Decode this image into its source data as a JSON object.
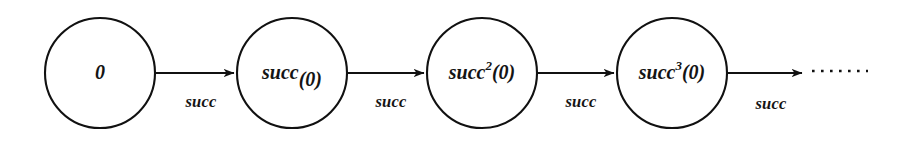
{
  "figure": {
    "background_color": "#ffffff",
    "stroke_color": "#111111",
    "text_color": "#141414"
  },
  "nodes": [
    {
      "id": "n0",
      "base": "0",
      "exponent": "",
      "suffix": "",
      "label": "0",
      "cx": 100,
      "cy": 73,
      "r": 55
    },
    {
      "id": "n1",
      "base": "succ",
      "exponent": "",
      "suffix": "(0)",
      "label": "succ(0)",
      "cx": 292,
      "cy": 73,
      "r": 55
    },
    {
      "id": "n2",
      "base": "succ",
      "exponent": "2",
      "suffix": "(0)",
      "label": "succ2(0)",
      "cx": 482,
      "cy": 73,
      "r": 55
    },
    {
      "id": "n3",
      "base": "succ",
      "exponent": "3",
      "suffix": "(0)",
      "label": "succ3(0)",
      "cx": 672,
      "cy": 73,
      "r": 55
    }
  ],
  "edges": [
    {
      "id": "e0",
      "label": "succ",
      "from": "n0",
      "to": "n1",
      "x1": 156,
      "x2": 234,
      "y": 73,
      "label_x": 201,
      "label_y": 107
    },
    {
      "id": "e1",
      "label": "succ",
      "from": "n1",
      "to": "n2",
      "x1": 348,
      "x2": 424,
      "y": 73,
      "label_x": 391,
      "label_y": 107
    },
    {
      "id": "e2",
      "label": "succ",
      "from": "n2",
      "to": "n3",
      "x1": 538,
      "x2": 614,
      "y": 73,
      "label_x": 581,
      "label_y": 107
    },
    {
      "id": "e3",
      "label": "succ",
      "from": "n3",
      "to": "ellipsis",
      "x1": 728,
      "x2": 802,
      "y": 73,
      "label_x": 771,
      "label_y": 109
    }
  ],
  "ellipsis": {
    "id": "trailing-ellipsis",
    "x1": 812,
    "x2": 868,
    "y": 71
  }
}
